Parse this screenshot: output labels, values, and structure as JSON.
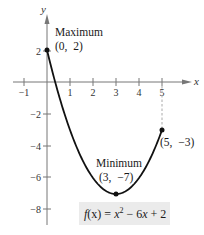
{
  "chart_data": {
    "type": "line",
    "title": "",
    "function": "f(x) = x^2 - 6x + 2",
    "function_label": {
      "prefix": "f",
      "arg": "(x)",
      "eq": " = ",
      "x": "x",
      "exp": "2",
      "rest1": " − 6",
      "x2": "x",
      "rest2": " + 2"
    },
    "xlabel": "x",
    "ylabel": "y",
    "xlim": [
      -1.5,
      6
    ],
    "ylim": [
      -9,
      3
    ],
    "x_ticks": [
      -1,
      1,
      2,
      3,
      4,
      5
    ],
    "x_tick_labels": [
      "−1",
      "1",
      "2",
      "3",
      "4",
      "5"
    ],
    "y_ticks": [
      2,
      -2,
      -4,
      -6,
      -8
    ],
    "y_tick_labels": [
      "2",
      "−2",
      "−4",
      "−6",
      "−8"
    ],
    "grid": false,
    "domain": [
      0,
      5
    ],
    "x": [
      0,
      0.5,
      1,
      1.5,
      2,
      2.5,
      3,
      3.5,
      4,
      4.5,
      5
    ],
    "y": [
      2,
      -0.75,
      -3,
      -4.75,
      -6,
      -6.75,
      -7,
      -6.75,
      -6,
      -4.75,
      -3
    ],
    "points": [
      {
        "x": 0,
        "y": 2,
        "label_title": "Maximum",
        "label_coord": "(0,  2)"
      },
      {
        "x": 3,
        "y": -7,
        "label_title": "Minimum",
        "label_coord": "(3,  −7)"
      },
      {
        "x": 5,
        "y": -3,
        "label_title": "",
        "label_coord": "(5,  −3)"
      }
    ],
    "annotations": [
      "Maximum (0, 2)",
      "Minimum (3, −7)",
      "(5, −3)"
    ],
    "colors": {
      "curve": "#111111",
      "axis": "#777777",
      "dashed": "#aaaaaa",
      "label_box": "#ebebeb"
    }
  }
}
